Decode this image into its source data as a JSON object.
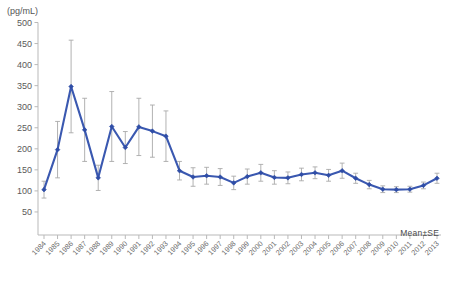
{
  "axis": {
    "unit_label": "(pg/mL)",
    "y_ticks": [
      500,
      450,
      400,
      350,
      300,
      250,
      200,
      150,
      100,
      50
    ],
    "y_min": 0,
    "y_max": 500
  },
  "annotation": {
    "mean_se": "Mean±SE"
  },
  "colors": {
    "series": "#3a58b0",
    "marker": "#2f4da6",
    "error_bar": "#a9a9a9",
    "axis": "#b9b9b9",
    "text": "#5a5a5a",
    "background": "#ffffff"
  },
  "chart_data": {
    "type": "line",
    "title": "",
    "xlabel": "",
    "ylabel": "(pg/mL)",
    "ylim": [
      0,
      500
    ],
    "grid": false,
    "legend": "none",
    "annotations": [
      "Mean±SE"
    ],
    "x": [
      "1984",
      "1985",
      "1986",
      "1987",
      "1988",
      "1989",
      "1990",
      "1991",
      "1992",
      "1993",
      "1994",
      "1995",
      "1996",
      "1997",
      "1998",
      "1999",
      "2000",
      "2001",
      "2002",
      "2003",
      "2004",
      "2005",
      "2006",
      "2007",
      "2008",
      "2009",
      "2010",
      "2011",
      "2012",
      "2013"
    ],
    "categories": [
      "1984",
      "1985",
      "1986",
      "1987",
      "1988",
      "1989",
      "1990",
      "1991",
      "1992",
      "1993",
      "1994",
      "1995",
      "1996",
      "1997",
      "1998",
      "1999",
      "2000",
      "2001",
      "2002",
      "2003",
      "2004",
      "2005",
      "2006",
      "2007",
      "2008",
      "2009",
      "2010",
      "2011",
      "2012",
      "2013"
    ],
    "series": [
      {
        "name": "Mean",
        "values": [
          103,
          198,
          348,
          245,
          131,
          253,
          203,
          252,
          242,
          230,
          148,
          133,
          136,
          133,
          119,
          134,
          143,
          132,
          131,
          139,
          143,
          137,
          148,
          130,
          115,
          104,
          103,
          104,
          113,
          130
        ],
        "errors": [
          20,
          67,
          110,
          75,
          30,
          83,
          38,
          68,
          62,
          60,
          22,
          22,
          20,
          20,
          16,
          18,
          20,
          16,
          14,
          15,
          14,
          14,
          18,
          12,
          10,
          8,
          7,
          7,
          8,
          12
        ]
      }
    ]
  }
}
